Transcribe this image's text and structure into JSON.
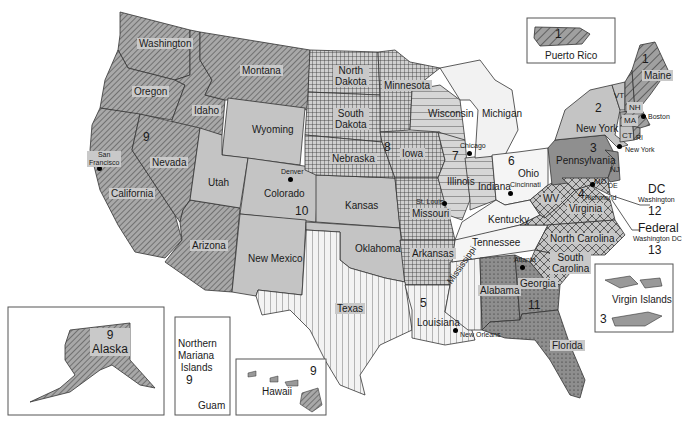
{
  "map": {
    "title": "Federal Regions of the United States",
    "colors": {
      "region9_fill": "#9a9a9a",
      "region10_fill": "#bdbdbd",
      "region8_fill": "#cfcfcf",
      "region7_fill": "#d3d3d3",
      "region6_fill": "#ececec",
      "region5_fill": "#f2f2f2",
      "region4_fill": "#c8c8c8",
      "region3_fill": "#8f8f8f",
      "region2_fill": "#c4c4c4",
      "region1_fill": "#9a9a9a",
      "stroke": "#333333",
      "label_bg": "#c9c9c9"
    },
    "states": [
      {
        "name": "Washington"
      },
      {
        "name": "Oregon"
      },
      {
        "name": "Idaho"
      },
      {
        "name": "Montana"
      },
      {
        "name": "Wyoming"
      },
      {
        "name": "Nevada"
      },
      {
        "name": "California"
      },
      {
        "name": "Utah"
      },
      {
        "name": "Colorado"
      },
      {
        "name": "Arizona"
      },
      {
        "name": "New Mexico"
      },
      {
        "name": "North Dakota"
      },
      {
        "name": "South Dakota"
      },
      {
        "name": "Nebraska"
      },
      {
        "name": "Kansas"
      },
      {
        "name": "Oklahoma"
      },
      {
        "name": "Texas"
      },
      {
        "name": "Minnesota"
      },
      {
        "name": "Iowa"
      },
      {
        "name": "Missouri"
      },
      {
        "name": "Arkansas"
      },
      {
        "name": "Louisiana"
      },
      {
        "name": "Mississippi"
      },
      {
        "name": "Wisconsin"
      },
      {
        "name": "Michigan"
      },
      {
        "name": "Illinois"
      },
      {
        "name": "Indiana"
      },
      {
        "name": "Ohio"
      },
      {
        "name": "Kentucky"
      },
      {
        "name": "Tennessee"
      },
      {
        "name": "Alabama"
      },
      {
        "name": "Georgia"
      },
      {
        "name": "Florida"
      },
      {
        "name": "South Carolina"
      },
      {
        "name": "North Carolina"
      },
      {
        "name": "Virginia"
      },
      {
        "name": "WV"
      },
      {
        "name": "Pennsylvania"
      },
      {
        "name": "New York"
      },
      {
        "name": "VT"
      },
      {
        "name": "NH"
      },
      {
        "name": "Maine"
      },
      {
        "name": "MA"
      },
      {
        "name": "CT"
      },
      {
        "name": "RI"
      },
      {
        "name": "NJ"
      },
      {
        "name": "MD"
      },
      {
        "name": "DE"
      }
    ],
    "labels": {
      "washington": "Washington",
      "oregon": "Oregon",
      "idaho": "Idaho",
      "montana": "Montana",
      "wyoming": "Wyoming",
      "nevada": "Nevada",
      "california": "California",
      "utah": "Utah",
      "colorado": "Colorado",
      "arizona": "Arizona",
      "new_mexico": "New Mexico",
      "north_dakota_1": "North",
      "north_dakota_2": "Dakota",
      "south_dakota_1": "South",
      "south_dakota_2": "Dakota",
      "nebraska": "Nebraska",
      "kansas": "Kansas",
      "oklahoma": "Oklahoma",
      "texas": "Texas",
      "minnesota": "Minnesota",
      "iowa": "Iowa",
      "missouri": "Missouri",
      "arkansas": "Arkansas",
      "louisiana": "Louisiana",
      "mississippi": "Mississippi",
      "wisconsin": "Wisconsin",
      "michigan": "Michigan",
      "illinois": "Illinois",
      "indiana": "Indiana",
      "ohio": "Ohio",
      "kentucky": "Kentucky",
      "tennessee": "Tennessee",
      "alabama": "Alabama",
      "georgia": "Georgia",
      "florida": "Florida",
      "south_carolina_1": "South",
      "south_carolina_2": "Carolina",
      "north_carolina": "North Carolina",
      "virginia": "Virginia",
      "wv": "WV",
      "pennsylvania": "Pennsylvania",
      "new_york": "New York",
      "vt": "VT",
      "nh": "NH",
      "maine": "Maine",
      "ma": "MA",
      "ct": "CT",
      "ri": "RI",
      "nj": "NJ",
      "md": "MD",
      "de": "DE"
    },
    "cities": {
      "san_francisco_1": "San",
      "san_francisco_2": "Francisco",
      "denver": "Denver",
      "chicago": "Chicago",
      "st_louis": "St. Louis",
      "cincinnati": "Cincinnati",
      "new_orleans": "New Orleans",
      "atlanta": "Atlanta",
      "boston": "Boston",
      "new_york": "New York",
      "richmond": "Richmond"
    },
    "regions": {
      "r1": "1",
      "r2": "2",
      "r3": "3",
      "r4": "4",
      "r5": "5",
      "r6": "6",
      "r7": "7",
      "r8": "8",
      "r9": "9",
      "r10": "10",
      "r11": "11",
      "r12": "12",
      "r13": "13"
    },
    "dc_callout": {
      "dc": "DC",
      "washington": "Washington",
      "region12": "12",
      "federal": "Federal",
      "washington_dc": "Washington DC",
      "region13": "13"
    },
    "insets": {
      "puerto_rico": {
        "label": "Puerto Rico",
        "region": "1"
      },
      "virgin_islands": {
        "label": "Virgin Islands",
        "region": "3"
      },
      "alaska": {
        "label": "Alaska",
        "region": "9"
      },
      "northern_mariana": {
        "label1": "Northern",
        "label2": "Mariana",
        "label3": "Islands",
        "region": "9",
        "guam": "Guam"
      },
      "hawaii": {
        "label": "Hawaii",
        "region": "9"
      }
    }
  }
}
